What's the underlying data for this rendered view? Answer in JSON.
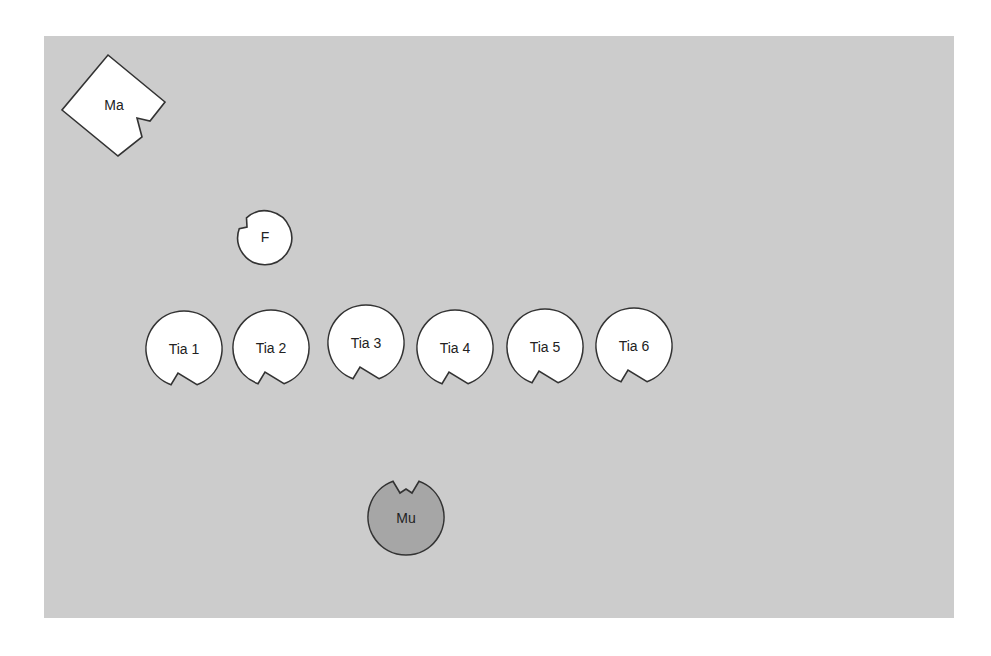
{
  "diagram": {
    "background": "#cccccc",
    "panel": {
      "x": 44,
      "y": 36,
      "w": 910,
      "h": 582
    },
    "colors": {
      "panel_fill": "#cccccc",
      "shape_fill": "#ffffff",
      "shape_dark_fill": "#a6a6a6",
      "stroke": "#333333",
      "text": "#222222"
    },
    "nodes": [
      {
        "id": "ma",
        "label": "Ma",
        "shape": "notched-square",
        "x": 113,
        "y": 105,
        "fill": "#ffffff"
      },
      {
        "id": "f",
        "label": "F",
        "shape": "notched-circle",
        "x": 265,
        "y": 237,
        "r": 27,
        "notch": "upper-left",
        "fill": "#ffffff"
      },
      {
        "id": "tia1",
        "label": "Tia 1",
        "shape": "notched-circle",
        "x": 184,
        "y": 349,
        "r": 38,
        "notch": "bottom",
        "fill": "#ffffff"
      },
      {
        "id": "tia2",
        "label": "Tia 2",
        "shape": "notched-circle",
        "x": 271,
        "y": 348,
        "r": 38,
        "notch": "bottom",
        "fill": "#ffffff"
      },
      {
        "id": "tia3",
        "label": "Tia 3",
        "shape": "notched-circle",
        "x": 366,
        "y": 343,
        "r": 38,
        "notch": "bottom",
        "fill": "#ffffff"
      },
      {
        "id": "tia4",
        "label": "Tia 4",
        "shape": "notched-circle",
        "x": 455,
        "y": 348,
        "r": 38,
        "notch": "bottom",
        "fill": "#ffffff"
      },
      {
        "id": "tia5",
        "label": "Tia 5",
        "shape": "notched-circle",
        "x": 545,
        "y": 347,
        "r": 38,
        "notch": "bottom",
        "fill": "#ffffff"
      },
      {
        "id": "tia6",
        "label": "Tia 6",
        "shape": "notched-circle",
        "x": 634,
        "y": 346,
        "r": 38,
        "notch": "bottom",
        "fill": "#ffffff"
      },
      {
        "id": "mu",
        "label": "Mu",
        "shape": "notched-circle",
        "x": 406,
        "y": 517,
        "r": 38,
        "notch": "top",
        "fill": "#a6a6a6"
      }
    ]
  }
}
